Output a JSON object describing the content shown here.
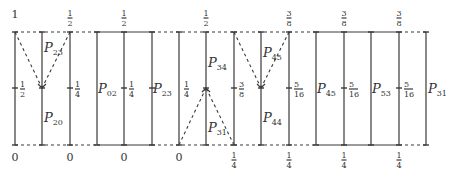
{
  "diagram": {
    "top_y": 32,
    "bottom_y": 145,
    "mid_y": 88,
    "lines_x": [
      15,
      42,
      70,
      97,
      124,
      152,
      179,
      206,
      234,
      261,
      289,
      316,
      344,
      371,
      399,
      426
    ],
    "top_labels": [
      {
        "x": 15,
        "num": "1",
        "den": ""
      },
      {
        "x": 70,
        "num": "1",
        "den": "2"
      },
      {
        "x": 124,
        "num": "1",
        "den": "2"
      },
      {
        "x": 206,
        "num": "1",
        "den": "2"
      },
      {
        "x": 289,
        "num": "3",
        "den": "8"
      },
      {
        "x": 344,
        "num": "3",
        "den": "8"
      },
      {
        "x": 399,
        "num": "3",
        "den": "8"
      }
    ],
    "bottom_labels": [
      {
        "x": 15,
        "num": "0",
        "den": ""
      },
      {
        "x": 70,
        "num": "0",
        "den": ""
      },
      {
        "x": 124,
        "num": "0",
        "den": ""
      },
      {
        "x": 179,
        "num": "0",
        "den": ""
      },
      {
        "x": 234,
        "num": "1",
        "den": "4"
      },
      {
        "x": 289,
        "num": "1",
        "den": "4"
      },
      {
        "x": 344,
        "num": "1",
        "den": "4"
      },
      {
        "x": 399,
        "num": "1",
        "den": "4"
      }
    ],
    "mid_labels": [
      {
        "x": 15,
        "num": "1",
        "den": "2"
      },
      {
        "x": 70,
        "num": "1",
        "den": "4"
      },
      {
        "x": 124,
        "num": "1",
        "den": "4"
      },
      {
        "x": 179,
        "num": "1",
        "den": "4"
      },
      {
        "x": 234,
        "num": "3",
        "den": "8"
      },
      {
        "x": 289,
        "num": "5",
        "den": "16"
      },
      {
        "x": 344,
        "num": "5",
        "den": "16"
      },
      {
        "x": 399,
        "num": "5",
        "den": "16"
      }
    ],
    "P_labels": [
      {
        "name": "P",
        "sub": "23",
        "x": 44,
        "y": 52
      },
      {
        "name": "P",
        "sub": "20",
        "x": 44,
        "y": 122
      },
      {
        "name": "P",
        "sub": "02",
        "x": 98,
        "y": 93
      },
      {
        "name": "P",
        "sub": "23",
        "x": 153,
        "y": 93
      },
      {
        "name": "P",
        "sub": "34",
        "x": 208,
        "y": 67
      },
      {
        "name": "P",
        "sub": "31",
        "x": 208,
        "y": 132
      },
      {
        "name": "P",
        "sub": "45",
        "x": 263,
        "y": 57
      },
      {
        "name": "P",
        "sub": "44",
        "x": 263,
        "y": 122
      },
      {
        "name": "P",
        "sub": "45",
        "x": 317,
        "y": 93
      },
      {
        "name": "P",
        "sub": "53",
        "x": 372,
        "y": 93
      },
      {
        "name": "P",
        "sub": "31",
        "x": 428,
        "y": 93
      }
    ]
  }
}
